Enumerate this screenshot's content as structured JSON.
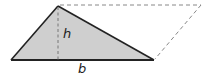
{
  "diagram": {
    "labels": {
      "height": "h",
      "base": "b"
    },
    "colors": {
      "triangle_fill": "#cfcfcf",
      "triangle_stroke": "#222222",
      "dashed_stroke": "#888888",
      "label": "#222222"
    },
    "shapes": {
      "triangle": [
        [
          11,
          60
        ],
        [
          58,
          6
        ],
        [
          154,
          60
        ]
      ],
      "parallelogram_dashed_edges": [
        [
          [
            58,
            6
          ],
          [
            201,
            5
          ]
        ],
        [
          [
            201,
            5
          ],
          [
            154,
            60
          ]
        ]
      ],
      "height_line": [
        [
          58,
          6
        ],
        [
          58,
          60
        ]
      ]
    }
  }
}
